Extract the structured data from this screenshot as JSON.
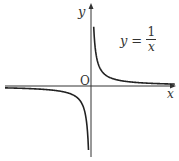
{
  "chart_data": {
    "type": "line",
    "title": "",
    "annotation": "y = 1/x",
    "xlabel": "x",
    "ylabel": "y",
    "origin_label": "O",
    "function": "1/x",
    "series": [
      {
        "name": "y = 1/x (x>0)",
        "x": [
          0.1,
          0.2,
          0.5,
          1,
          2,
          3,
          5
        ],
        "y": [
          10,
          5,
          2,
          1,
          0.5,
          0.333,
          0.2
        ]
      },
      {
        "name": "y = 1/x (x<0)",
        "x": [
          -5,
          -3,
          -2,
          -1,
          -0.5,
          -0.2,
          -0.1
        ],
        "y": [
          -0.2,
          -0.333,
          -0.5,
          -1,
          -2,
          -5,
          -10
        ]
      }
    ],
    "grid": false,
    "ticks": "none"
  },
  "labels": {
    "x_axis": "x",
    "y_axis": "y",
    "origin": "O",
    "formula_lhs": "y",
    "formula_eq": "=",
    "formula_num": "1",
    "formula_den": "x"
  },
  "colors": {
    "axis": "#333333",
    "curve": "#222222"
  }
}
